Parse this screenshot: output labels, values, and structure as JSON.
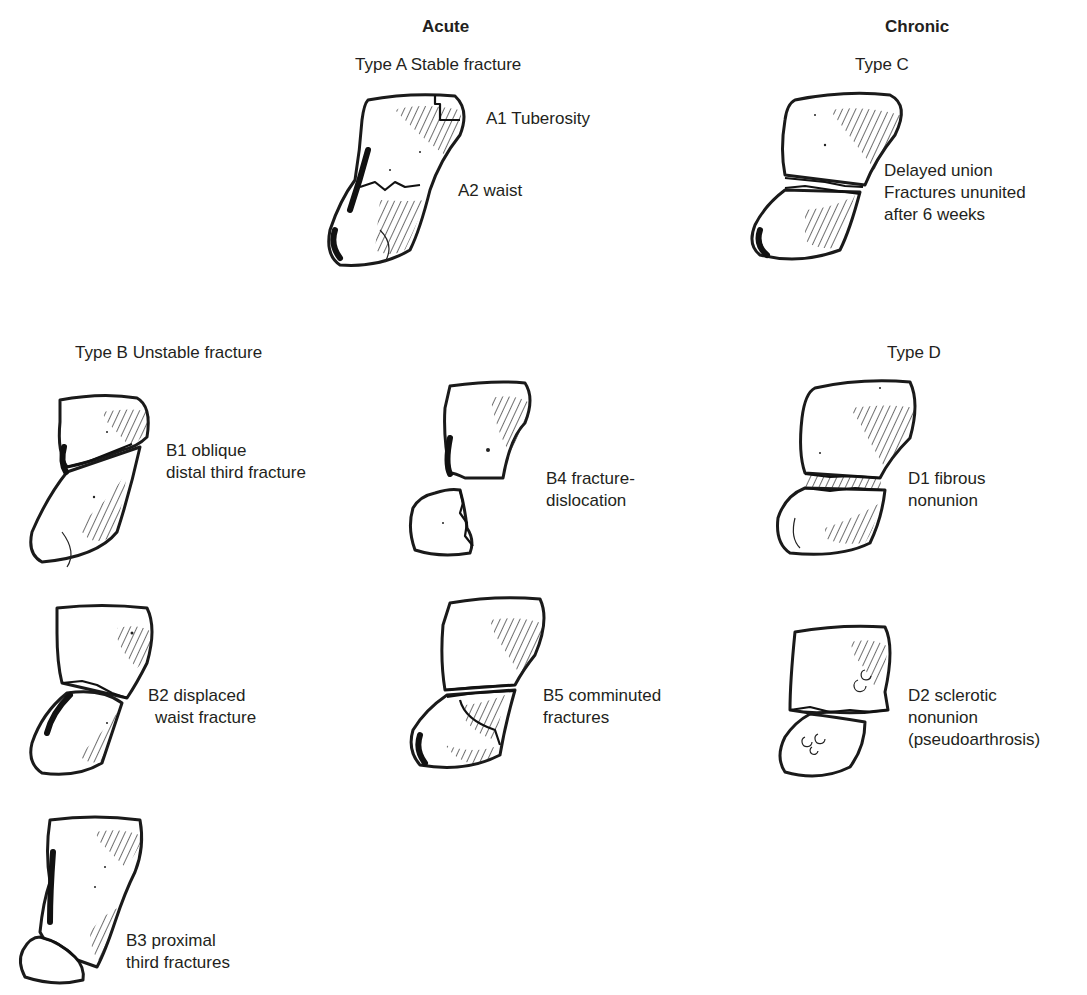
{
  "headers": {
    "acute": "Acute",
    "chronic": "Chronic"
  },
  "types": {
    "a": "Type A Stable fracture",
    "b": "Type B Unstable fracture",
    "c": "Type C",
    "d": "Type D"
  },
  "labels": {
    "a1": "A1 Tuberosity",
    "a2": "A2 waist",
    "c": [
      "Delayed union",
      "Fractures ununited",
      "after 6 weeks"
    ],
    "b1": [
      "B1 oblique",
      "distal third fracture"
    ],
    "b2": [
      "B2 displaced",
      "waist fracture"
    ],
    "b3": [
      "B3 proximal",
      "third fractures"
    ],
    "b4": [
      "B4 fracture-",
      "dislocation"
    ],
    "b5": [
      "B5 comminuted",
      "fractures"
    ],
    "d1": [
      "D1 fibrous",
      "nonunion"
    ],
    "d2": [
      "D2 sclerotic",
      "nonunion",
      "(pseudoarthrosis)"
    ]
  },
  "colors": {
    "ink": "#231f20",
    "background": "#ffffff"
  }
}
